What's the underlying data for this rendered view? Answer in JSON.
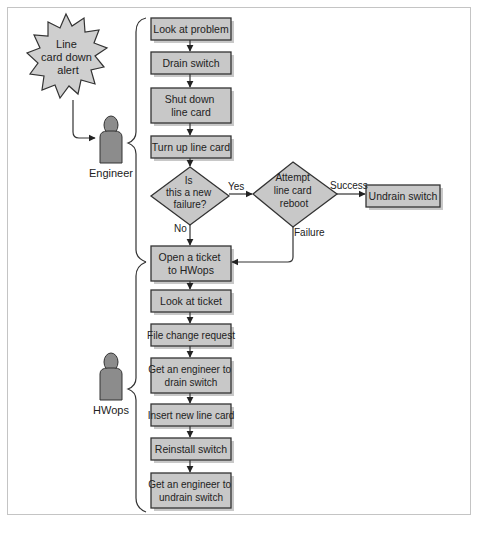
{
  "figure": {
    "type": "swimlane flowchart",
    "trigger": {
      "label_lines": [
        "Line",
        "card down",
        "alert"
      ],
      "shape": "starburst"
    },
    "actors": [
      {
        "id": "engineer",
        "label": "Engineer",
        "icon": "person-icon"
      },
      {
        "id": "hwops",
        "label": "HWops",
        "icon": "person-icon"
      }
    ],
    "steps": [
      {
        "id": "look_problem",
        "actor": "engineer",
        "lines": [
          "Look at problem"
        ]
      },
      {
        "id": "drain_switch",
        "actor": "engineer",
        "lines": [
          "Drain switch"
        ]
      },
      {
        "id": "shut_down",
        "actor": "engineer",
        "lines": [
          "Shut down",
          "line card"
        ]
      },
      {
        "id": "turn_up",
        "actor": "engineer",
        "lines": [
          "Turn up line card"
        ]
      },
      {
        "id": "is_new_failure",
        "actor": "engineer",
        "type": "decision",
        "lines": [
          "Is",
          "this a new",
          "failure?"
        ]
      },
      {
        "id": "attempt_reboot",
        "actor": "engineer",
        "type": "decision",
        "lines": [
          "Attempt",
          "line card",
          "reboot"
        ]
      },
      {
        "id": "undrain_switch",
        "actor": "engineer",
        "lines": [
          "Undrain switch"
        ]
      },
      {
        "id": "open_ticket",
        "actor": "hwops",
        "lines": [
          "Open a ticket",
          "to HWops"
        ]
      },
      {
        "id": "look_ticket",
        "actor": "hwops",
        "lines": [
          "Look at ticket"
        ]
      },
      {
        "id": "file_change",
        "actor": "hwops",
        "lines": [
          "File change request"
        ]
      },
      {
        "id": "get_engineer_drain",
        "actor": "hwops",
        "lines": [
          "Get an engineer to",
          "drain switch"
        ]
      },
      {
        "id": "insert_card",
        "actor": "hwops",
        "lines": [
          "Insert new line card"
        ]
      },
      {
        "id": "reinstall",
        "actor": "hwops",
        "lines": [
          "Reinstall switch"
        ]
      },
      {
        "id": "get_engineer_undrain",
        "actor": "hwops",
        "lines": [
          "Get an engineer to",
          "undrain switch"
        ]
      }
    ],
    "edges": [
      {
        "from": "trigger",
        "to": "engineer"
      },
      {
        "from": "look_problem",
        "to": "drain_switch"
      },
      {
        "from": "drain_switch",
        "to": "shut_down"
      },
      {
        "from": "shut_down",
        "to": "turn_up"
      },
      {
        "from": "turn_up",
        "to": "is_new_failure"
      },
      {
        "from": "is_new_failure",
        "to": "attempt_reboot",
        "label": "Yes"
      },
      {
        "from": "is_new_failure",
        "to": "open_ticket",
        "label": "No"
      },
      {
        "from": "attempt_reboot",
        "to": "undrain_switch",
        "label": "Success"
      },
      {
        "from": "attempt_reboot",
        "to": "open_ticket",
        "label": "Failure"
      },
      {
        "from": "open_ticket",
        "to": "look_ticket"
      },
      {
        "from": "look_ticket",
        "to": "file_change"
      },
      {
        "from": "file_change",
        "to": "get_engineer_drain"
      },
      {
        "from": "get_engineer_drain",
        "to": "insert_card"
      },
      {
        "from": "insert_card",
        "to": "reinstall"
      },
      {
        "from": "reinstall",
        "to": "get_engineer_undrain"
      }
    ],
    "edge_labels": {
      "yes": "Yes",
      "no": "No",
      "success": "Success",
      "failure": "Failure"
    },
    "colors": {
      "box_fill": "#c8c8c8",
      "stroke": "#333333",
      "person_fill": "#8c8c8c",
      "frame": "#c4c4c4"
    }
  }
}
